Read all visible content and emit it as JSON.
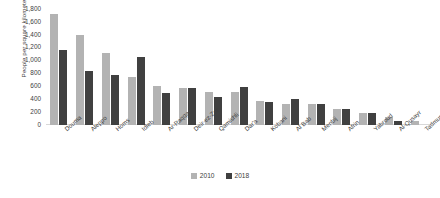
{
  "chart_data": {
    "type": "bar",
    "title": "",
    "xlabel": "",
    "ylabel": "People per square kilometer",
    "ylim": [
      0,
      1800
    ],
    "yticks": [
      "0",
      "200",
      "400",
      "600",
      "800",
      "1,000",
      "1,200",
      "1,400",
      "1,600",
      "1,800"
    ],
    "grid": false,
    "legend_position": "bottom-center",
    "categories": [
      "Douma",
      "Aleppo",
      "Homs",
      "Idleb",
      "Ar-Raqqa",
      "Deir-ez-Zor",
      "Qamishli",
      "Dar'a",
      "Kobani",
      "Al Bab",
      "Menbij",
      "Afrin",
      "Yabroud",
      "Al-Qusayr",
      "Tadmur"
    ],
    "series": [
      {
        "name": "2010",
        "color": "#b3b3b3",
        "values": [
          1720,
          1400,
          1110,
          740,
          600,
          580,
          520,
          520,
          370,
          330,
          320,
          250,
          190,
          130,
          70
        ]
      },
      {
        "name": "2018",
        "color": "#404040",
        "values": [
          1160,
          840,
          780,
          1060,
          500,
          570,
          430,
          590,
          350,
          410,
          330,
          250,
          190,
          60,
          0
        ]
      }
    ]
  },
  "legend": {
    "items": [
      {
        "label": "2010"
      },
      {
        "label": "2018"
      }
    ]
  }
}
